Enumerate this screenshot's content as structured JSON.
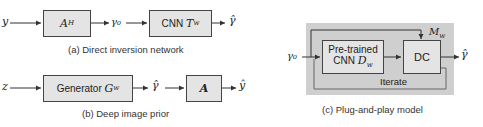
{
  "diagram_a": {
    "input": "y",
    "block1": "A",
    "block1_sup": "H",
    "mid": "γ₀",
    "block2_prefix": "CNN",
    "block2_sym": "T",
    "block2_sub": "w",
    "output": "γ̂",
    "caption": "(a) Direct inversion network"
  },
  "diagram_b": {
    "input": "z",
    "block1_prefix": "Generator",
    "block1_sym": "G",
    "block1_sub": "w",
    "mid": "γ̂",
    "block2": "A",
    "output": "ŷ",
    "caption": "(b) Deep image prior"
  },
  "diagram_c": {
    "input": "γ₀",
    "block1_line1": "Pre-trained",
    "block1_line2": "CNN",
    "block1_sym": "D",
    "block1_sub": "w",
    "block2": "DC",
    "model_sym": "M",
    "model_sub": "w",
    "loop_label": "Iterate",
    "output": "γ̂",
    "caption": "(c) Plug-and-play model"
  }
}
